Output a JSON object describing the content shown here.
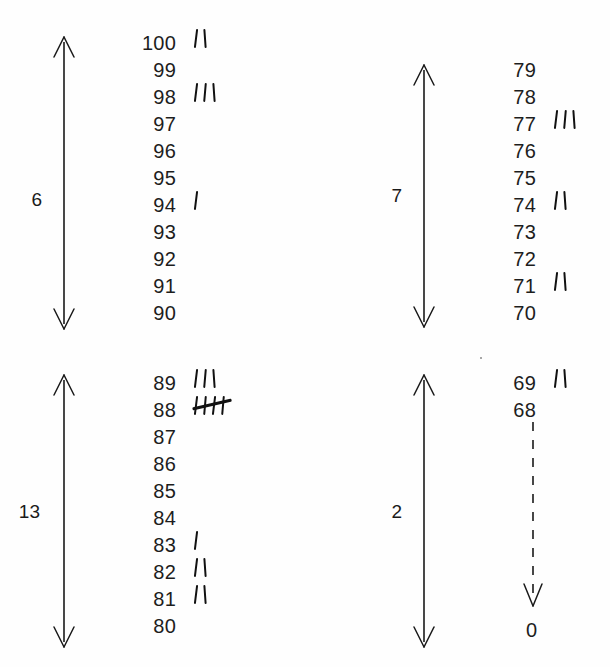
{
  "figure": {
    "kind": "tally-chart",
    "background_color": "#fefefe",
    "ink_color": "#1a1a1a"
  },
  "chart_data": {
    "type": "table",
    "title": "",
    "subtitle": "",
    "xlabel": "",
    "ylabel": "",
    "groups": [
      {
        "id": "group-90-100",
        "bracket_label": "6",
        "range_top": 100,
        "range_bottom": 90,
        "categories": [
          100,
          99,
          98,
          97,
          96,
          95,
          94,
          93,
          92,
          91,
          90
        ],
        "values": [
          2,
          0,
          3,
          0,
          0,
          0,
          1,
          0,
          0,
          0,
          0
        ]
      },
      {
        "id": "group-70-79",
        "bracket_label": "7",
        "range_top": 79,
        "range_bottom": 70,
        "categories": [
          79,
          78,
          77,
          76,
          75,
          74,
          73,
          72,
          71,
          70
        ],
        "values": [
          0,
          0,
          3,
          0,
          0,
          2,
          0,
          0,
          2,
          0
        ]
      },
      {
        "id": "group-80-89",
        "bracket_label": "13",
        "range_top": 89,
        "range_bottom": 80,
        "categories": [
          89,
          88,
          87,
          86,
          85,
          84,
          83,
          82,
          81,
          80
        ],
        "values": [
          3,
          5,
          0,
          0,
          0,
          0,
          1,
          2,
          2,
          0
        ]
      },
      {
        "id": "group-0-69",
        "bracket_label": "2",
        "range_top": 69,
        "range_bottom": 0,
        "categories": [
          69,
          68,
          0
        ],
        "values": [
          2,
          0,
          0
        ]
      }
    ]
  },
  "groups": {
    "topleft": {
      "bracket_label": "6",
      "rows": [
        {
          "value": "100",
          "tally": 2,
          "crossed": false
        },
        {
          "value": "99",
          "tally": 0,
          "crossed": false
        },
        {
          "value": "98",
          "tally": 3,
          "crossed": false
        },
        {
          "value": "97",
          "tally": 0,
          "crossed": false
        },
        {
          "value": "96",
          "tally": 0,
          "crossed": false
        },
        {
          "value": "95",
          "tally": 0,
          "crossed": false
        },
        {
          "value": "94",
          "tally": 1,
          "crossed": false
        },
        {
          "value": "93",
          "tally": 0,
          "crossed": false
        },
        {
          "value": "92",
          "tally": 0,
          "crossed": false
        },
        {
          "value": "91",
          "tally": 0,
          "crossed": false
        },
        {
          "value": "90",
          "tally": 0,
          "crossed": false
        }
      ]
    },
    "topright": {
      "bracket_label": "7",
      "rows": [
        {
          "value": "79",
          "tally": 0,
          "crossed": false
        },
        {
          "value": "78",
          "tally": 0,
          "crossed": false
        },
        {
          "value": "77",
          "tally": 3,
          "crossed": false
        },
        {
          "value": "76",
          "tally": 0,
          "crossed": false
        },
        {
          "value": "75",
          "tally": 0,
          "crossed": false
        },
        {
          "value": "74",
          "tally": 2,
          "crossed": false
        },
        {
          "value": "73",
          "tally": 0,
          "crossed": false
        },
        {
          "value": "72",
          "tally": 0,
          "crossed": false
        },
        {
          "value": "71",
          "tally": 2,
          "crossed": false
        },
        {
          "value": "70",
          "tally": 0,
          "crossed": false
        }
      ]
    },
    "bottomleft": {
      "bracket_label": "13",
      "rows": [
        {
          "value": "89",
          "tally": 3,
          "crossed": false
        },
        {
          "value": "88",
          "tally": 4,
          "crossed": true
        },
        {
          "value": "87",
          "tally": 0,
          "crossed": false
        },
        {
          "value": "86",
          "tally": 0,
          "crossed": false
        },
        {
          "value": "85",
          "tally": 0,
          "crossed": false
        },
        {
          "value": "84",
          "tally": 0,
          "crossed": false
        },
        {
          "value": "83",
          "tally": 1,
          "crossed": false
        },
        {
          "value": "82",
          "tally": 2,
          "crossed": false
        },
        {
          "value": "81",
          "tally": 2,
          "crossed": false
        },
        {
          "value": "80",
          "tally": 0,
          "crossed": false
        }
      ]
    },
    "bottomright": {
      "bracket_label": "2",
      "rows": [
        {
          "value": "69",
          "tally": 2,
          "crossed": false
        },
        {
          "value": "68",
          "tally": 0,
          "crossed": false
        }
      ],
      "tail_label": "0"
    }
  }
}
